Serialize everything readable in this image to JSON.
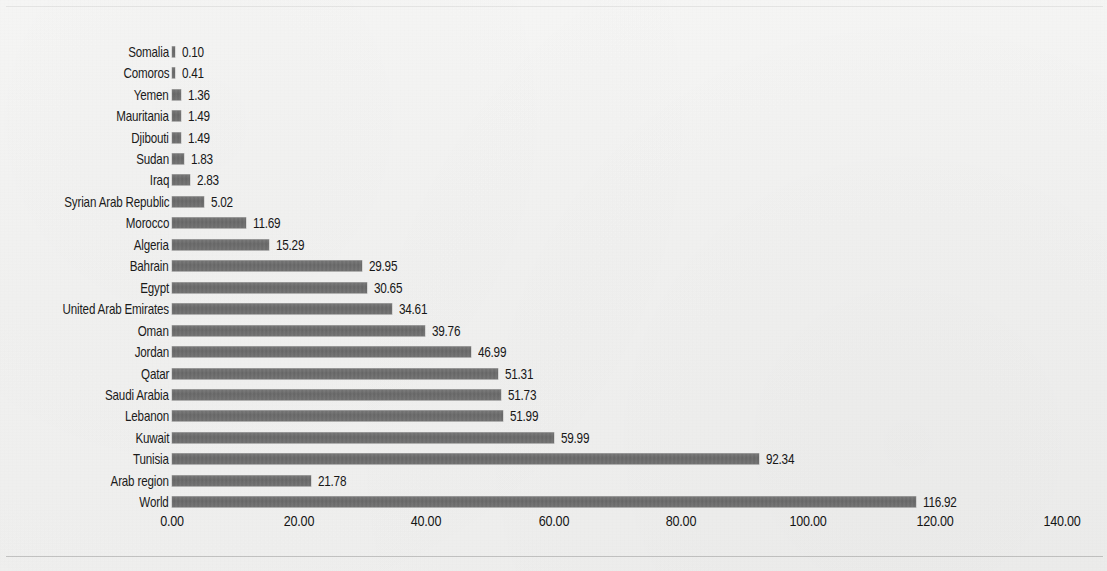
{
  "chart_data": {
    "type": "bar",
    "orientation": "horizontal",
    "title": "",
    "subtitle": "",
    "xlabel": "",
    "ylabel": "",
    "xlim": [
      0,
      140
    ],
    "grid": false,
    "legend": null,
    "tick_labels": [
      "0.00",
      "20.00",
      "40.00",
      "60.00",
      "80.00",
      "100.00",
      "120.00",
      "140.00"
    ],
    "tick_values": [
      0,
      20,
      40,
      60,
      80,
      100,
      120,
      140
    ],
    "value_label_format": "0.00",
    "bar_color": "#6b6b6b",
    "background_color": "#f3f3f2",
    "categories": [
      "Somalia",
      "Comoros",
      "Yemen",
      "Mauritania",
      "Djibouti",
      "Sudan",
      "Iraq",
      "Syrian Arab Republic",
      "Morocco",
      "Algeria",
      "Bahrain",
      "Egypt",
      "United Arab Emirates",
      "Oman",
      "Jordan",
      "Qatar",
      "Saudi Arabia",
      "Lebanon",
      "Kuwait",
      "Tunisia",
      "Arab region",
      "World"
    ],
    "values": [
      0.1,
      0.41,
      1.36,
      1.49,
      1.49,
      1.83,
      2.83,
      5.02,
      11.69,
      15.29,
      29.95,
      30.65,
      34.61,
      39.76,
      46.99,
      51.31,
      51.73,
      51.99,
      59.99,
      92.34,
      21.78,
      116.92
    ],
    "value_labels": [
      "0.10",
      "0.41",
      "1.36",
      "1.49",
      "1.49",
      "1.83",
      "2.83",
      "5.02",
      "11.69",
      "15.29",
      "29.95",
      "30.65",
      "34.61",
      "39.76",
      "46.99",
      "51.31",
      "51.73",
      "51.99",
      "59.99",
      "92.34",
      "21.78",
      "116.92"
    ]
  }
}
